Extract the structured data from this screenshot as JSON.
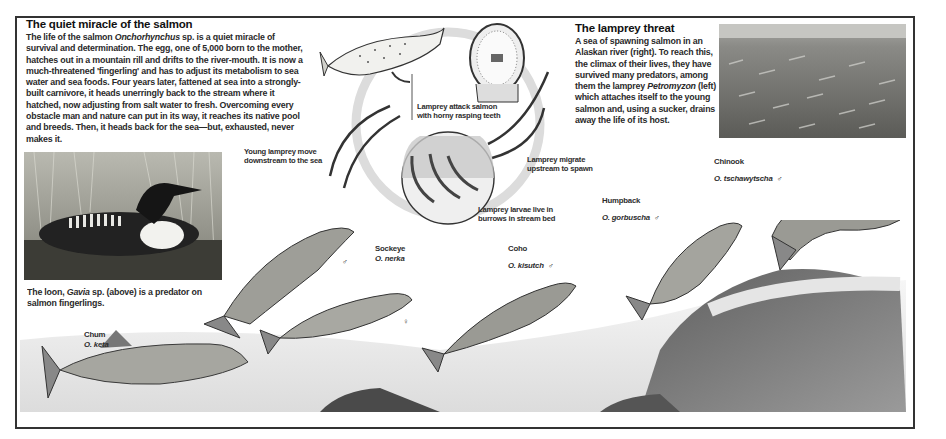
{
  "intro": {
    "title": "The quiet miracle of the salmon",
    "lines": [
      "The life of the salmon ",
      "Onchorhynchus",
      " sp. is a quiet miracle of survival and determination. The egg, one of 5,000 born to the mother, hatches out in a mountain rill and drifts to the river-mouth. It is now a much-threatened 'fingerling' and has to adjust its metabolism to sea water and sea foods. Four years later, fattened at sea into a strongly-built carnivore, it heads unerringly back to the stream where it hatched, now adjusting from salt water to fresh. Overcoming every obstacle man and nature can put in its way, it reaches its native pool and breeds. Then, it heads back for the sea—but, exhausted, never makes it."
    ]
  },
  "lamprey_box": {
    "title": "The lamprey threat",
    "text_pre": "A sea of spawning salmon in an Alaskan river (right). To reach this, the climax of their lives, they have survived many predators, among them the lamprey ",
    "genus": "Petromyzon",
    "text_post": " (left) which attaches itself to the young salmon and, using a sucker, drains away the life of its host."
  },
  "loon_caption": {
    "pre": "The loon, ",
    "genus": "Gavia",
    "post": " sp. (above) is a predator on salmon fingerlings."
  },
  "lifecycle_labels": {
    "attack": [
      "Lamprey attack salmon",
      "with horny rasping teeth"
    ],
    "young": [
      "Young lamprey move",
      "downstream to the sea"
    ],
    "migrate": [
      "Lamprey migrate",
      "upstream to spawn"
    ],
    "larvae": [
      "Lamprey larvae live in",
      "burrows in stream bed"
    ]
  },
  "species": [
    {
      "common": "Chum",
      "latin": "O. keta",
      "sex": ""
    },
    {
      "common": "Sockeye",
      "latin": "O. nerka",
      "sex": ""
    },
    {
      "common": "Coho",
      "latin": "O. kisutch",
      "sex": "♂"
    },
    {
      "common": "Humpback",
      "latin": "O. gorbuscha",
      "sex": "♂"
    },
    {
      "common": "Chinook",
      "latin": "O. tschawytscha",
      "sex": "♂"
    }
  ],
  "sex_marks": {
    "sockeye_male": "♂",
    "sockeye_female": "♀"
  },
  "colors": {
    "frame": "#333333",
    "text": "#1c1c1c",
    "ring": "#d8d8d8"
  }
}
